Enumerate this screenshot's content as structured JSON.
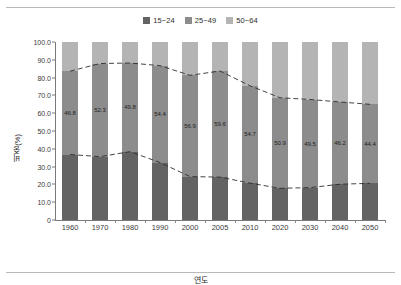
{
  "legend": {
    "position": "top-center",
    "items": [
      {
        "label": "15~24",
        "color": "#636363"
      },
      {
        "label": "25~49",
        "color": "#8c8c8c"
      },
      {
        "label": "50~64",
        "color": "#b4b4b4"
      }
    ]
  },
  "axes": {
    "ylabel": "비중(%)",
    "xlabel": "연도",
    "yticks": [
      "100.0",
      "90.0",
      "80.0",
      "70.0",
      "60.0",
      "50.0",
      "40.0",
      "30.0",
      "20.0",
      "10.0",
      "0"
    ]
  },
  "chart_data": {
    "type": "bar",
    "stacked": true,
    "title": "",
    "xlabel": "연도",
    "ylabel": "비중(%)",
    "ylim": [
      0,
      100
    ],
    "grid": false,
    "legend_position": "top-center",
    "categories": [
      "1960",
      "1970",
      "1980",
      "1990",
      "2000",
      "2005",
      "2010",
      "2020",
      "2030",
      "2040",
      "2050"
    ],
    "series": [
      {
        "name": "15~24",
        "color": "#636363",
        "values": [
          36.8,
          35.6,
          38.4,
          32.3,
          24.4,
          24.1,
          20.7,
          17.8,
          18.2,
          20.1,
          20.6
        ]
      },
      {
        "name": "25~49",
        "color": "#8c8c8c",
        "values": [
          46.8,
          52.3,
          49.8,
          54.4,
          56.9,
          59.6,
          54.7,
          50.9,
          49.5,
          46.2,
          44.4
        ],
        "data_labels": [
          "46.8",
          "52.3",
          "49.8",
          "54.4",
          "56.9",
          "59.6",
          "54.7",
          "50.9",
          "49.5",
          "46.2",
          "44.4"
        ]
      },
      {
        "name": "50~64",
        "color": "#b4b4b4",
        "values": [
          16.4,
          12.1,
          11.8,
          13.3,
          18.7,
          16.3,
          24.6,
          31.3,
          32.3,
          33.7,
          35.0
        ]
      }
    ],
    "annotations": [
      {
        "type": "dashed-line",
        "name": "upper-boundary-line",
        "values": [
          83.6,
          87.9,
          88.2,
          86.7,
          81.3,
          83.7,
          75.4,
          68.7,
          67.7,
          66.3,
          65.0
        ]
      },
      {
        "type": "dashed-line",
        "name": "lower-boundary-line",
        "values": [
          36.8,
          35.6,
          38.4,
          32.3,
          24.4,
          24.1,
          20.7,
          17.8,
          18.2,
          20.1,
          20.6
        ]
      }
    ]
  }
}
